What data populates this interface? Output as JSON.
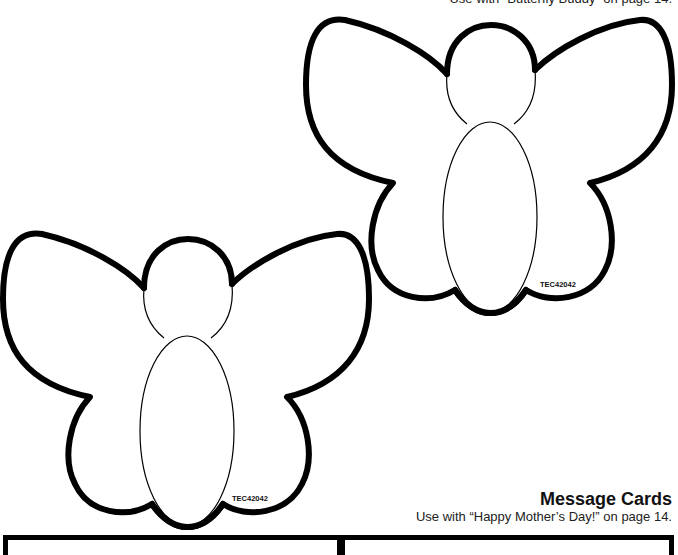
{
  "header": {
    "caption": "Use with “Butterfly Buddy” on page 14."
  },
  "butterflies": [
    {
      "name": "butterfly-pattern-top-right",
      "label": "TEC42042"
    },
    {
      "name": "butterfly-pattern-bottom-left",
      "label": "TEC42042"
    }
  ],
  "message_cards": {
    "title": "Message Cards",
    "subtitle": "Use with “Happy Mother’s Day!” on page 14.",
    "cards": [
      {
        "name": "message-card-left"
      },
      {
        "name": "message-card-right"
      }
    ]
  },
  "colors": {
    "outline": "#000000",
    "background": "#ffffff"
  }
}
